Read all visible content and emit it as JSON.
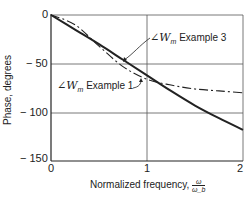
{
  "chart_data": {
    "type": "line",
    "title": "",
    "xlabel": "Normalized frequency, ω/ω_b",
    "ylabel": "Phase, degrees",
    "xlim": [
      0,
      2
    ],
    "ylim": [
      -150,
      0
    ],
    "grid": true,
    "x_ticks": [
      "0",
      "1",
      "2"
    ],
    "y_ticks": [
      "0",
      "− 50",
      "− 100",
      "− 150"
    ],
    "series": [
      {
        "name": "∠W_m Example 3",
        "style": "solid",
        "x": [
          0,
          0.25,
          0.5,
          0.75,
          1.0,
          1.25,
          1.5,
          1.75,
          2.0
        ],
        "values": [
          0,
          -15,
          -30,
          -46,
          -62,
          -78,
          -93,
          -106,
          -118
        ]
      },
      {
        "name": "∠W_m Example 1",
        "style": "dash-dot",
        "x": [
          0,
          0.25,
          0.5,
          0.75,
          1.0,
          1.25,
          1.5,
          1.75,
          2.0
        ],
        "values": [
          0,
          -10,
          -32,
          -53,
          -66,
          -72,
          -76,
          -78,
          -80
        ]
      }
    ],
    "annotations": [
      {
        "text": "∠W_m Example 3",
        "points_to": "solid curve near x≈0.75"
      },
      {
        "text": "∠W_m Example 1",
        "points_to": "dash-dot curve near x≈1.0"
      }
    ]
  },
  "labels": {
    "ylabel": "Phase, degrees",
    "xlabel_text": "Normalized frequency,",
    "xlabel_num": "ω",
    "xlabel_den": "ω_b",
    "ann3_sym": "∠W",
    "ann3_sub": "m",
    "ann3_text": " Example 3",
    "ann1_sym": "∠W",
    "ann1_sub": "m",
    "ann1_text": " Example 1",
    "ytick_0": "0",
    "ytick_50": "− 50",
    "ytick_100": "− 100",
    "ytick_150": "− 150",
    "xtick_0": "0",
    "xtick_1": "1",
    "xtick_2": "2"
  }
}
